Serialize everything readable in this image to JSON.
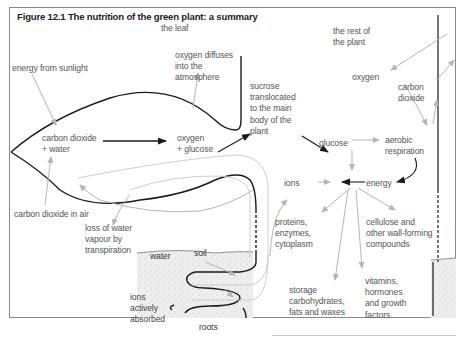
{
  "figure": {
    "title": "Figure 12.1  The nutrition of the green plant: a summary",
    "regions": {
      "leaf": "the leaf",
      "rest_of_plant": "the rest of\nthe plant",
      "soil": "soil",
      "roots": "roots"
    },
    "labels": {
      "energy_from_sunlight": "energy from sunlight",
      "oxygen_diffuses": "oxygen diffuses\ninto the\natmosphere",
      "co2_water": "carbon dioxide\n+ water",
      "oxygen_glucose": "oxygen\n+ glucose",
      "co2_in_air": "carbon dioxide in air",
      "sucrose": "sucrose\ntranslocated\nto the main\nbody of the\nplant",
      "glucose": "glucose",
      "oxygen": "oxygen",
      "carbon_dioxide": "carbon\ndioxide",
      "aerobic_respiration": "aerobic\nrespiration",
      "energy": "energy",
      "ions": "ions",
      "loss_of_water": "loss of water\nvapour by\ntranspiration",
      "water": "water",
      "ions_absorbed": "ions\nactively\nabsorbed",
      "proteins": "proteins,\nenzymes,\ncytoplasm",
      "cellulose": "cellulose and\nother wall-forming\ncompounds",
      "storage": "storage\ncarbohydrates,\nfats and waxes",
      "vitamins": "vitamins,\nhormones\nand growth\nfactors"
    },
    "colors": {
      "outline": "#1a1a1a",
      "arrow_gray": "#b5b5b5",
      "arrow_black": "#1a1a1a",
      "label": "#555555",
      "soil_fill": "#ececec"
    }
  }
}
